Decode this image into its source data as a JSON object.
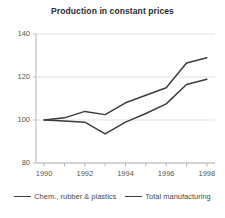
{
  "chart_data": {
    "type": "line",
    "title": "Production in constant prices",
    "xlabel": "",
    "ylabel": "",
    "x": [
      1990,
      1991,
      1992,
      1993,
      1994,
      1995,
      1996,
      1997,
      1998
    ],
    "xlim": [
      1989.6,
      1998.4
    ],
    "ylim": [
      80,
      140
    ],
    "yticks": [
      80,
      100,
      120,
      140
    ],
    "ytick_labels": [
      "80",
      "100",
      "120",
      "140"
    ],
    "xticks": [
      1990,
      1992,
      1994,
      1996,
      1998
    ],
    "xtick_labels": [
      "1990",
      "1992",
      "1994",
      "1996",
      "1998"
    ],
    "xminor_ticks": [
      1991,
      1993,
      1995,
      1997
    ],
    "grid": "horizontal",
    "legend_position": "bottom",
    "series": [
      {
        "name": "Chem., rubber & plastics",
        "color": "#3c3c3c",
        "values": [
          100,
          101,
          104,
          102.5,
          108,
          111.5,
          115,
          126.5,
          129
        ]
      },
      {
        "name": "Total manufacturing",
        "color": "#3c3c3c",
        "values": [
          100,
          99.5,
          99,
          93.5,
          99,
          103,
          107.5,
          116.5,
          119
        ]
      }
    ]
  },
  "colors": {
    "background": "#ffffff",
    "axis": "#b8b8b8",
    "grid": "#dcdcdc",
    "line": "#3c3c3c",
    "text": "#4a4a4a",
    "title": "#2b2b2b"
  }
}
